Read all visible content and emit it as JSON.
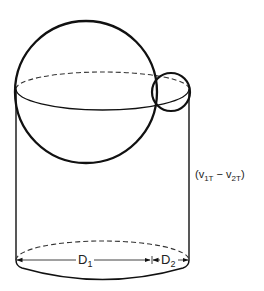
{
  "diagram": {
    "title": "",
    "colors": {
      "stroke": "#111111",
      "text": "#222222",
      "background": "#ffffff"
    },
    "labels": {
      "velocity_diff": {
        "open": "(",
        "v1": "v",
        "v1_sub": "1T",
        "minus": " − ",
        "v2": "v",
        "v2_sub": "2T",
        "close": ")"
      },
      "d1": {
        "main": "D",
        "sub": "1"
      },
      "d2": {
        "main": "D",
        "sub": "2"
      }
    },
    "shapes": {
      "large_sphere": {
        "cx": 86,
        "cy": 92,
        "r": 71
      },
      "small_sphere": {
        "cx": 171,
        "cy": 92,
        "r": 19
      },
      "cylinder": {
        "left_x": 16,
        "right_x": 189,
        "top_y": 90,
        "bottom_y": 260
      },
      "top_ellipse": {
        "cx": 102.5,
        "cy": 91,
        "rx": 86.5,
        "ry": 19
      },
      "bottom_ellipse": {
        "cx": 102.5,
        "cy": 260,
        "rx": 86.5,
        "ry": 19
      },
      "dimension_line_y": 260,
      "d_divider_x": 152
    }
  }
}
